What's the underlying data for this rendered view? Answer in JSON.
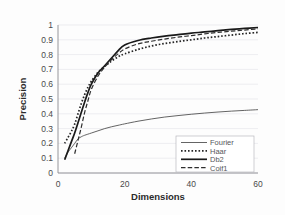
{
  "chart_data": {
    "type": "line",
    "title": "",
    "xlabel": "Dimensions",
    "ylabel": "Precision",
    "xlim": [
      0,
      60
    ],
    "ylim": [
      0,
      1
    ],
    "grid": true,
    "legend_position": "bottom-right",
    "x_ticks": [
      "0",
      "20",
      "40",
      "60"
    ],
    "x_tick_values": [
      0,
      20,
      40,
      60
    ],
    "y_ticks": [
      "0",
      "0.1",
      "0.2",
      "0.3",
      "0.4",
      "0.5",
      "0.6",
      "0.7",
      "0.8",
      "0.9",
      "1"
    ],
    "y_tick_values": [
      0,
      0.1,
      0.2,
      0.3,
      0.4,
      0.5,
      0.6,
      0.7,
      0.8,
      0.9,
      1
    ],
    "series": [
      {
        "name": "Fourier",
        "style": "solid-thin",
        "color": "#3c3c3c",
        "x": [
          2,
          3,
          4,
          5,
          6,
          7,
          8,
          10,
          12,
          14,
          16,
          18,
          20,
          24,
          28,
          32,
          36,
          40,
          44,
          48,
          52,
          56,
          60
        ],
        "values": [
          0.1,
          0.14,
          0.17,
          0.2,
          0.23,
          0.245,
          0.255,
          0.27,
          0.285,
          0.3,
          0.312,
          0.322,
          0.332,
          0.35,
          0.365,
          0.378,
          0.388,
          0.397,
          0.405,
          0.412,
          0.418,
          0.423,
          0.428
        ]
      },
      {
        "name": "Haar",
        "style": "dotted",
        "color": "#262626",
        "x": [
          2,
          3,
          4,
          5,
          6,
          7,
          8,
          9,
          10,
          12,
          14,
          16,
          18,
          20,
          24,
          28,
          32,
          36,
          40,
          44,
          48,
          52,
          56,
          60
        ],
        "values": [
          0.2,
          0.24,
          0.28,
          0.33,
          0.4,
          0.47,
          0.53,
          0.58,
          0.62,
          0.68,
          0.72,
          0.755,
          0.785,
          0.805,
          0.835,
          0.858,
          0.875,
          0.888,
          0.9,
          0.912,
          0.922,
          0.932,
          0.942,
          0.95
        ]
      },
      {
        "name": "Db2",
        "style": "solid-thick",
        "color": "#1a1a1a",
        "x": [
          2,
          3,
          4,
          5,
          6,
          7,
          8,
          9,
          10,
          12,
          14,
          16,
          18,
          20,
          24,
          28,
          32,
          36,
          40,
          44,
          48,
          52,
          56,
          60
        ],
        "values": [
          0.09,
          0.15,
          0.21,
          0.27,
          0.34,
          0.41,
          0.48,
          0.545,
          0.6,
          0.675,
          0.725,
          0.775,
          0.825,
          0.865,
          0.895,
          0.912,
          0.925,
          0.935,
          0.945,
          0.953,
          0.962,
          0.97,
          0.977,
          0.983
        ]
      },
      {
        "name": "Coif1",
        "style": "dashed",
        "color": "#2e2e2e",
        "x": [
          5,
          6,
          7,
          8,
          9,
          10,
          12,
          14,
          16,
          18,
          20,
          24,
          28,
          32,
          36,
          40,
          44,
          48,
          52,
          56,
          60
        ],
        "values": [
          0.13,
          0.22,
          0.31,
          0.41,
          0.49,
          0.565,
          0.655,
          0.715,
          0.765,
          0.805,
          0.838,
          0.872,
          0.89,
          0.905,
          0.918,
          0.928,
          0.94,
          0.95,
          0.958,
          0.966,
          0.974
        ]
      }
    ]
  },
  "legend": {
    "items": [
      {
        "label": "Fourier"
      },
      {
        "label": "Haar"
      },
      {
        "label": "Db2"
      },
      {
        "label": "Coif1"
      }
    ]
  }
}
